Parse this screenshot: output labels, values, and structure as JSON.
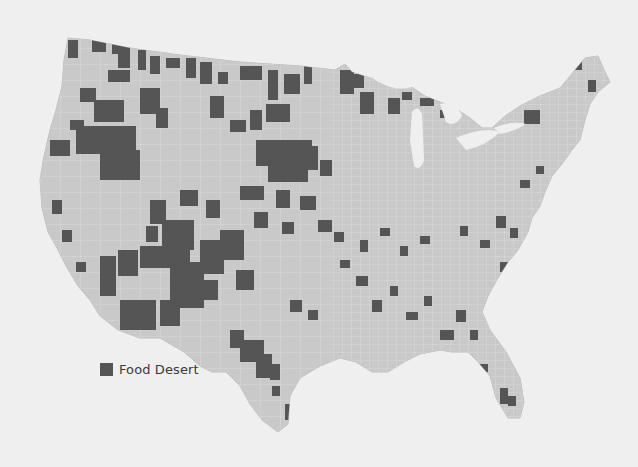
{
  "map": {
    "title": "Food deserts in the contiguous United States (by county)",
    "colors": {
      "background": "#efefef",
      "land": "#c9c9c9",
      "county_border": "#dedede",
      "food_desert": "#555555",
      "water": "#efefef"
    }
  },
  "legend": {
    "items": [
      {
        "label": "Food Desert",
        "color": "#555555"
      }
    ]
  }
}
